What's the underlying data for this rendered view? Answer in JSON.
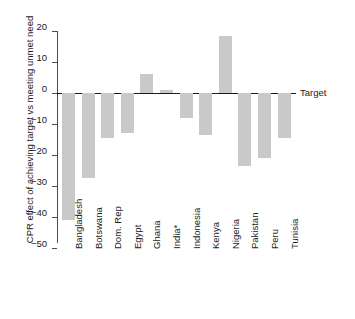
{
  "chart_data": {
    "type": "bar",
    "title": "",
    "subtitle": "",
    "xlabel": "",
    "ylabel": "CPR effect of achieving target vs meeting unmet need",
    "categories": [
      "Bangladesh",
      "Botswana",
      "Dom. Rep",
      "Egypt",
      "Ghana",
      "India*",
      "Indonesia",
      "Kenya",
      "Nigeria",
      "Pakistan",
      "Peru",
      "Tunisia"
    ],
    "values": [
      -41,
      -27.4,
      -14.5,
      -13,
      6,
      1,
      -8,
      -13.5,
      18.5,
      -23.5,
      -21,
      -14.5
    ],
    "ylim": [
      -50,
      20
    ],
    "yticks": [
      20,
      10,
      0,
      -10,
      -20,
      -30,
      -40,
      -50
    ],
    "ytick_labels": [
      "20",
      "10",
      "0",
      "−10",
      "−20",
      "−30",
      "−40",
      "−50"
    ],
    "grid": false,
    "legend": false,
    "annotations": [
      {
        "name": "target-line-label",
        "text": "Target",
        "y": 0
      }
    ],
    "bar_color": "#c9c9c9",
    "axis_color": "#4d4d4d",
    "zero_line_color": "#1a1a1a"
  },
  "axis": {
    "y_title": "CPR effect of achieving target vs meeting unmet need"
  },
  "target": {
    "label": "Target"
  }
}
